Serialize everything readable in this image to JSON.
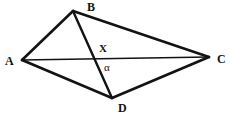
{
  "figure": {
    "kind": "geometry-diagram",
    "background_color": "#ffffff",
    "stroke_color": "#131313",
    "canvas": {
      "width": 230,
      "height": 115
    },
    "vertices": [
      {
        "id": "A",
        "label": "A",
        "x": 22,
        "y": 60,
        "label_x": 5,
        "label_y": 55
      },
      {
        "id": "B",
        "label": "B",
        "x": 73,
        "y": 11,
        "label_x": 87,
        "label_y": 1
      },
      {
        "id": "C",
        "label": "C",
        "x": 209,
        "y": 57,
        "label_x": 217,
        "label_y": 53
      },
      {
        "id": "D",
        "label": "D",
        "x": 112,
        "y": 98,
        "label_x": 118,
        "label_y": 102
      }
    ],
    "interior_points": [
      {
        "id": "X",
        "label": "X",
        "x": 95,
        "y": 58,
        "label_x": 99,
        "label_y": 43
      }
    ],
    "angles": [
      {
        "id": "alpha",
        "label": "α",
        "at_point": "X",
        "label_x": 104,
        "label_y": 62
      }
    ],
    "segments": [
      {
        "id": "AB",
        "from": "A",
        "to": "B",
        "kind": "side",
        "width": 2.6
      },
      {
        "id": "BC",
        "from": "B",
        "to": "C",
        "kind": "side",
        "width": 2.6
      },
      {
        "id": "CD",
        "from": "C",
        "to": "D",
        "kind": "side",
        "width": 2.6
      },
      {
        "id": "DA",
        "from": "D",
        "to": "A",
        "kind": "side",
        "width": 2.6
      },
      {
        "id": "AC",
        "from": "A",
        "to": "C",
        "kind": "diagonal",
        "width": 1.7
      },
      {
        "id": "BD",
        "from": "B",
        "to": "D",
        "kind": "diagonal",
        "width": 2.4
      }
    ]
  }
}
